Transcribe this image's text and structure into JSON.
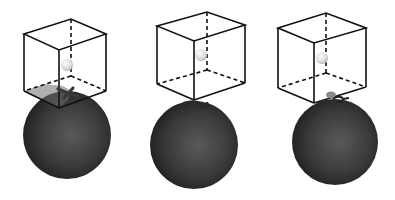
{
  "figure": {
    "panels": [
      {
        "id": "panel-1",
        "cube": {
          "front_tl": [
            24,
            34
          ],
          "front_tr": [
            59,
            50
          ],
          "front_bl": [
            24,
            91
          ],
          "front_br": [
            59,
            108
          ],
          "back_offset": [
            47,
            -15
          ]
        },
        "sphere": {
          "cx": 67,
          "cy": 135,
          "r": 44
        },
        "ball": {
          "cx": 67,
          "cy": 65,
          "r": 6
        },
        "molecule": {
          "x": 68,
          "y": 94,
          "shape": "cross"
        }
      },
      {
        "id": "panel-2",
        "cube": {
          "front_tl": [
            157,
            26
          ],
          "front_tr": [
            194,
            41
          ],
          "front_bl": [
            157,
            84
          ],
          "front_br": [
            194,
            100
          ],
          "back_offset": [
            38,
            -14
          ]
        },
        "sphere": {
          "cx": 194,
          "cy": 145,
          "r": 44
        },
        "ball": {
          "cx": 201,
          "cy": 55,
          "r": 6
        },
        "molecule": {
          "x": 196,
          "y": 103,
          "shape": "squiggle"
        }
      },
      {
        "id": "panel-3",
        "cube": {
          "front_tl": [
            278,
            28
          ],
          "front_tr": [
            314,
            43
          ],
          "front_bl": [
            278,
            88
          ],
          "front_br": [
            314,
            103
          ],
          "back_offset": [
            40,
            -15
          ]
        },
        "sphere": {
          "cx": 335,
          "cy": 142,
          "r": 43
        },
        "ball": {
          "cx": 322,
          "cy": 58,
          "r": 6
        },
        "molecule": {
          "x": 337,
          "y": 98,
          "shape": "ring"
        }
      }
    ],
    "colors": {
      "background": "#ffffff",
      "cube_edges": "#111111",
      "sphere_dark": "#2a2a2a",
      "sphere_mid": "#4a4a4a",
      "ball": "#e0e0e0",
      "molecule": "#3a3a3a"
    }
  }
}
